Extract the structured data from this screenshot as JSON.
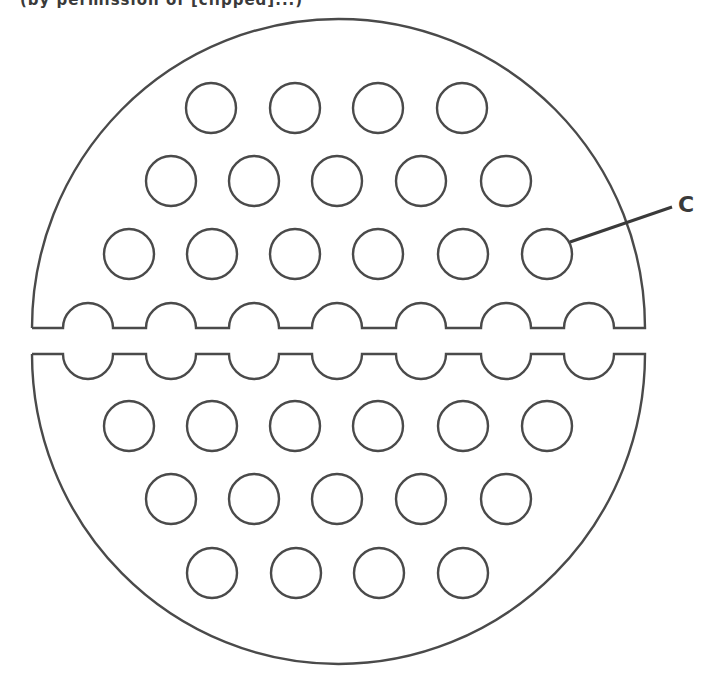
{
  "caption": {
    "text": "(by permission of [clipped]...)",
    "visible_fragments": [
      "(by",
      "permission",
      "of",
      ")"
    ],
    "note": "Caption is cut off at the top edge; middle words not legible"
  },
  "figure": {
    "stroke_color": "#4a4a4a",
    "background": "#ffffff",
    "hole_radius": 25,
    "outer_shape": {
      "left_x": 32,
      "right_x": 645,
      "top_half": {
        "edge_y": 328,
        "apex_y": 19
      },
      "bottom_half": {
        "edge_y": 354,
        "apex_y": 664
      }
    },
    "notch_centers_x": [
      88,
      171,
      254,
      337,
      421,
      506,
      589
    ],
    "hole_rows": [
      {
        "y": 108,
        "x": [
          211,
          295,
          378,
          462
        ]
      },
      {
        "y": 181,
        "x": [
          171,
          254,
          337,
          421,
          506
        ]
      },
      {
        "y": 254,
        "x": [
          129,
          212,
          295,
          378,
          463,
          547
        ]
      },
      {
        "y": 426,
        "x": [
          129,
          212,
          295,
          378,
          463,
          547
        ]
      },
      {
        "y": 499,
        "x": [
          171,
          254,
          337,
          421,
          506
        ]
      },
      {
        "y": 573,
        "x": [
          212,
          296,
          379,
          463
        ]
      }
    ],
    "labels": [
      {
        "text": "C",
        "points_to": "tube-hole",
        "leader_from": [
          570,
          242
        ],
        "leader_to": [
          672,
          207
        ]
      }
    ]
  }
}
